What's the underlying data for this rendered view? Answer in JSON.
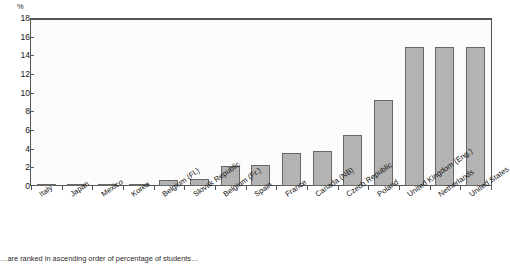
{
  "chart_data": {
    "type": "bar",
    "title": "",
    "subtitle": "",
    "xlabel": "",
    "ylabel": "%",
    "ylim": [
      0,
      18
    ],
    "yticks": [
      0,
      2,
      4,
      6,
      8,
      10,
      12,
      14,
      16,
      18
    ],
    "grid": false,
    "legend": null,
    "orientation": "vertical",
    "bar_color": "#b3b3b3",
    "bar_edge_color": "#676767",
    "categories": [
      "Italy",
      "Japan",
      "Mexico",
      "Korea",
      "Belgium (Fl.)",
      "Slovak Republic",
      "Belgium (Fr.)",
      "Spain",
      "France",
      "Canada (NB)",
      "Czech Republic",
      "Poland",
      "United Kingdom (Eng.)",
      "Netherlands",
      "United States"
    ],
    "values": [
      0.0,
      0.0,
      0.2,
      0.15,
      0.6,
      0.8,
      2.1,
      2.2,
      3.5,
      3.8,
      5.5,
      9.2,
      14.9,
      14.9,
      14.9
    ]
  },
  "axis": {
    "unit_label": "%"
  },
  "footnote": {
    "text": "…are ranked in ascending order of percentage of students…"
  }
}
